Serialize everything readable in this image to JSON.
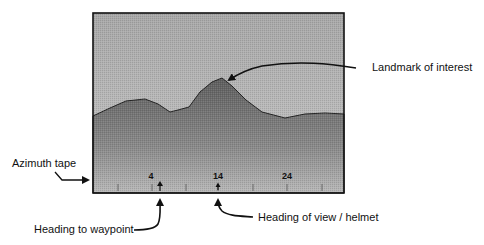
{
  "diagram": {
    "type": "helmet-display-schematic",
    "display": {
      "sky_color": "#b9b9b9",
      "terrain_color": "#7a7a7a",
      "frame_color": "#111111"
    },
    "azimuth_tape": {
      "labels": [
        {
          "value": "4",
          "x": 152
        },
        {
          "value": "14",
          "x": 218
        },
        {
          "value": "24",
          "x": 287
        }
      ],
      "tick_xs": [
        118,
        152,
        186,
        218,
        253,
        287,
        322
      ],
      "waypoint_marker_x": 160,
      "view_marker_x": 218
    },
    "callouts": {
      "landmark": "Landmark of interest",
      "azimuth_tape": "Azimuth tape",
      "heading_to_waypoint": "Heading to waypoint",
      "heading_of_view": "Heading of view / helmet"
    }
  }
}
